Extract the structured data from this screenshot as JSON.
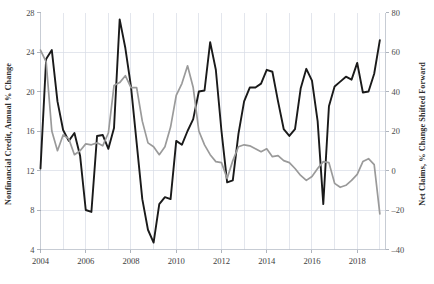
{
  "chart_data": {
    "type": "line",
    "title": "",
    "subtitle": "",
    "xlabel": "",
    "ylabel": "Nonfinancial Credit, Annual % Change",
    "y2label": "Net Claims, % Change Shifted Forward",
    "grid": true,
    "legend": "none",
    "xlim": [
      2004.0,
      2019.25
    ],
    "ylim": [
      4,
      28
    ],
    "y2lim": [
      -40,
      80
    ],
    "xticks": [
      2004,
      2006,
      2008,
      2010,
      2012,
      2014,
      2016,
      2018
    ],
    "xtick_labels": [
      "2004",
      "2006",
      "2008",
      "2010",
      "2012",
      "2014",
      "2016",
      "2018"
    ],
    "xminor_gridlines": [
      2005,
      2007,
      2009,
      2011,
      2013,
      2015,
      2017,
      2019
    ],
    "yticks": [
      4,
      8,
      12,
      16,
      20,
      24,
      28
    ],
    "ytick_labels": [
      "4",
      "8",
      "12",
      "16",
      "20",
      "24",
      "28"
    ],
    "y2ticks": [
      -40,
      -20,
      0,
      20,
      40,
      60,
      80
    ],
    "y2tick_labels": [
      "–40",
      "–20",
      "0",
      "20",
      "40",
      "60",
      "80"
    ],
    "series": [
      {
        "name": "Nonfinancial Credit, Annual % Change",
        "axis": "left",
        "color": "#1a1a1a",
        "width": 1.9,
        "x": [
          2004.0,
          2004.25,
          2004.5,
          2004.75,
          2005.0,
          2005.25,
          2005.5,
          2005.75,
          2006.0,
          2006.25,
          2006.5,
          2006.75,
          2007.0,
          2007.25,
          2007.5,
          2007.75,
          2008.0,
          2008.25,
          2008.5,
          2008.75,
          2009.0,
          2009.25,
          2009.5,
          2009.75,
          2010.0,
          2010.25,
          2010.5,
          2010.75,
          2011.0,
          2011.25,
          2011.5,
          2011.75,
          2012.0,
          2012.25,
          2012.5,
          2012.75,
          2013.0,
          2013.25,
          2013.5,
          2013.75,
          2014.0,
          2014.25,
          2014.5,
          2014.75,
          2015.0,
          2015.25,
          2015.5,
          2015.75,
          2016.0,
          2016.25,
          2016.5,
          2016.75,
          2017.0,
          2017.25,
          2017.5,
          2017.75,
          2018.0,
          2018.25,
          2018.5,
          2018.75,
          2019.0
        ],
        "y": [
          12.2,
          23.3,
          24.2,
          19.0,
          16.1,
          15.0,
          15.8,
          13.5,
          8.0,
          7.8,
          15.5,
          15.6,
          14.2,
          16.3,
          27.3,
          24.4,
          20.5,
          14.8,
          9.1,
          6.0,
          4.7,
          8.6,
          9.3,
          9.1,
          15.0,
          14.6,
          16.0,
          17.2,
          20.0,
          20.1,
          25.0,
          22.2,
          16.0,
          10.8,
          11.0,
          15.7,
          19.0,
          20.4,
          20.4,
          20.8,
          22.2,
          22.0,
          19.0,
          16.2,
          15.5,
          16.2,
          20.3,
          22.3,
          21.1,
          17.0,
          8.6,
          18.5,
          20.5,
          21.0,
          21.5,
          21.2,
          22.9,
          19.9,
          20.0,
          21.8,
          25.2
        ]
      },
      {
        "name": "Net Claims, % Change Shifted Forward",
        "axis": "right",
        "color": "#9a9a9a",
        "width": 1.7,
        "x": [
          2004.0,
          2004.25,
          2004.5,
          2004.75,
          2005.0,
          2005.25,
          2005.5,
          2005.75,
          2006.0,
          2006.25,
          2006.5,
          2006.75,
          2007.0,
          2007.25,
          2007.5,
          2007.75,
          2008.0,
          2008.25,
          2008.5,
          2008.75,
          2009.0,
          2009.25,
          2009.5,
          2009.75,
          2010.0,
          2010.25,
          2010.5,
          2010.75,
          2011.0,
          2011.25,
          2011.5,
          2011.75,
          2012.0,
          2012.25,
          2012.5,
          2012.75,
          2013.0,
          2013.25,
          2013.5,
          2013.75,
          2014.0,
          2014.25,
          2014.5,
          2014.75,
          2015.0,
          2015.25,
          2015.5,
          2015.75,
          2016.0,
          2016.25,
          2016.5,
          2016.75,
          2017.0,
          2017.25,
          2017.5,
          2017.75,
          2018.0,
          2018.25,
          2018.5,
          2018.75,
          2019.0
        ],
        "y": [
          61.0,
          55.0,
          20.0,
          10.0,
          18.0,
          16.0,
          8.0,
          10.0,
          13.5,
          13.0,
          14.0,
          12.5,
          19.0,
          43.0,
          44.5,
          48.0,
          42.0,
          42.0,
          25.0,
          14.0,
          12.0,
          8.0,
          12.0,
          22.0,
          38.0,
          44.0,
          53.0,
          42.0,
          20.0,
          13.0,
          8.0,
          4.5,
          4.0,
          -4.0,
          5.0,
          12.0,
          13.0,
          12.5,
          11.0,
          9.5,
          11.0,
          7.0,
          7.5,
          5.0,
          4.0,
          1.0,
          -2.5,
          -5.0,
          -3.0,
          1.0,
          4.5,
          4.0,
          -6.5,
          -8.5,
          -7.5,
          -5.0,
          -2.0,
          4.5,
          6.0,
          3.0,
          -22.0
        ]
      }
    ]
  }
}
